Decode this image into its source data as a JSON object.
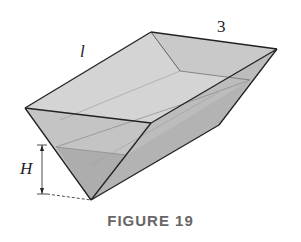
{
  "figure": {
    "caption": "FIGURE 19",
    "labels": {
      "length": "l",
      "width": "3",
      "height": "H"
    },
    "colors": {
      "edge": "#222222",
      "outer_face": "#cfcfcf",
      "inner_face": "#bdbdbd",
      "water": "#a9a9a9",
      "caption": "#666666"
    }
  }
}
